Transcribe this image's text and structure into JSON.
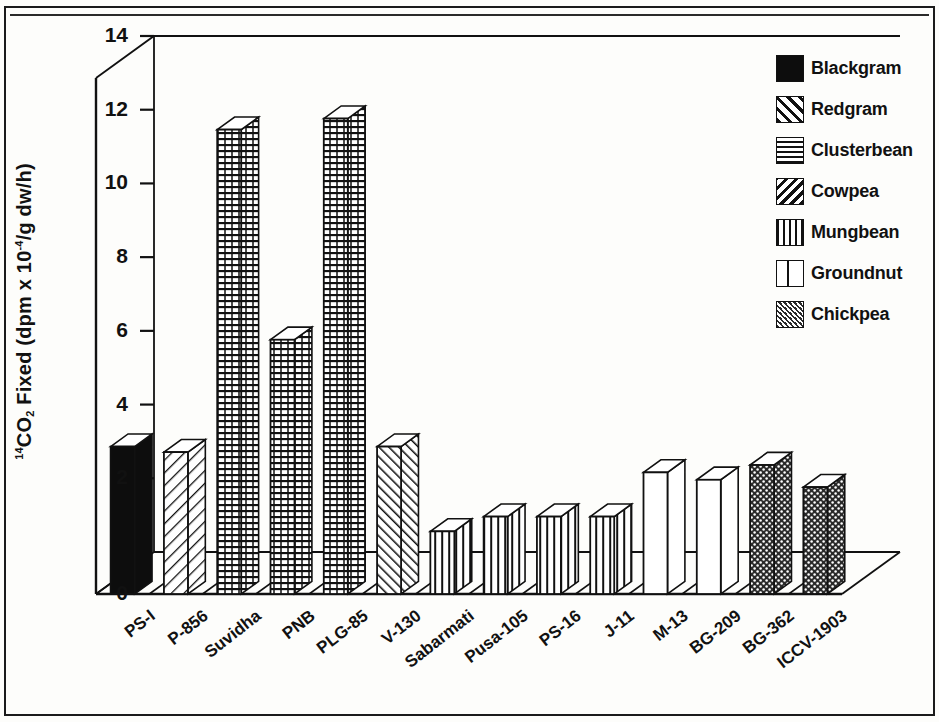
{
  "chart_data": {
    "type": "bar",
    "title": "",
    "xlabel": "",
    "ylabel": "14CO2 Fixed (dpm x 10-4/g dw/h)",
    "ylabel_parts": {
      "sup_left": "14",
      "base1": "CO",
      "sub": "2",
      "base2": " Fixed (dpm x 10",
      "sup_exp": "-4",
      "base3": "/g dw/h)"
    },
    "categories": [
      "PS-I",
      "P-856",
      "Suvidha",
      "PNB",
      "PLG-85",
      "V-130",
      "Sabarmati",
      "Pusa-105",
      "PS-16",
      "J-11",
      "M-13",
      "BG-209",
      "BG-362",
      "ICCV-1903"
    ],
    "values": [
      4.0,
      3.85,
      12.6,
      6.9,
      12.9,
      4.0,
      1.7,
      2.1,
      2.1,
      2.1,
      3.3,
      3.1,
      3.5,
      2.9
    ],
    "groups": [
      "Blackgram",
      "Redgram",
      "Clusterbean",
      "Clusterbean",
      "Clusterbean",
      "Cowpea",
      "Mungbean",
      "Mungbean",
      "Mungbean",
      "Mungbean",
      "Groundnut",
      "Groundnut",
      "Chickpea",
      "Chickpea"
    ],
    "ylim": [
      0,
      14
    ],
    "yticks": [
      0,
      2,
      4,
      6,
      8,
      10,
      12,
      14
    ],
    "ytick_labels": [
      "0",
      "2",
      "4",
      "6",
      "8",
      "10",
      "12",
      "14"
    ],
    "grid": false,
    "projection": "3d-bar",
    "legend_position": "top-right"
  },
  "legend": {
    "items": [
      {
        "label": "Blackgram",
        "pattern": "solid-black"
      },
      {
        "label": "Redgram",
        "pattern": "diagonal-hatch-up"
      },
      {
        "label": "Clusterbean",
        "pattern": "horizontal-lines"
      },
      {
        "label": "Cowpea",
        "pattern": "diagonal-hatch-down"
      },
      {
        "label": "Mungbean",
        "pattern": "vertical-lines"
      },
      {
        "label": "Groundnut",
        "pattern": "open-white"
      },
      {
        "label": "Chickpea",
        "pattern": "dotted-stipple"
      }
    ]
  },
  "colors": {
    "ink": "#111111",
    "paper": "#fdfdfb",
    "bar_fill": "#ffffff",
    "solid": "#0d0d0d"
  }
}
